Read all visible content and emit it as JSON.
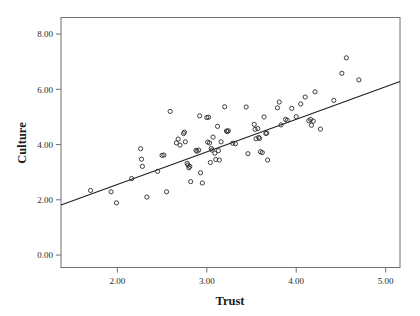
{
  "chart_data": {
    "type": "scatter",
    "title": "",
    "xlabel": "Trust",
    "ylabel": "Culture",
    "xlim": [
      1.37,
      5.16
    ],
    "ylim": [
      -0.45,
      8.6
    ],
    "xticks": [
      2.0,
      3.0,
      4.0,
      5.0
    ],
    "xtick_labels": [
      "2.00",
      "3.00",
      "4.00",
      "5.00"
    ],
    "yticks": [
      0.0,
      2.0,
      4.0,
      6.0,
      8.0
    ],
    "ytick_labels": [
      "0.00",
      "2.00",
      "4.00",
      "6.00",
      "8.00"
    ],
    "grid": false,
    "legend": "none",
    "marker": "open-circle",
    "fit_line": {
      "type": "linear",
      "x_start": 1.37,
      "y_start": 1.81,
      "x_end": 5.16,
      "y_end": 6.28,
      "slope": 1.179,
      "intercept": 0.194
    },
    "points": [
      [
        1.7,
        2.34
      ],
      [
        1.93,
        2.29
      ],
      [
        1.99,
        1.89
      ],
      [
        2.16,
        2.77
      ],
      [
        2.26,
        3.85
      ],
      [
        2.27,
        3.47
      ],
      [
        2.28,
        3.21
      ],
      [
        2.33,
        2.1
      ],
      [
        2.45,
        3.03
      ],
      [
        2.5,
        3.61
      ],
      [
        2.52,
        3.62
      ],
      [
        2.55,
        2.29
      ],
      [
        2.59,
        5.2
      ],
      [
        2.66,
        4.06
      ],
      [
        2.68,
        4.2
      ],
      [
        2.7,
        3.98
      ],
      [
        2.74,
        4.4
      ],
      [
        2.75,
        4.45
      ],
      [
        2.76,
        4.1
      ],
      [
        2.78,
        3.32
      ],
      [
        2.79,
        3.26
      ],
      [
        2.8,
        3.16
      ],
      [
        2.81,
        3.21
      ],
      [
        2.82,
        2.66
      ],
      [
        2.88,
        3.79
      ],
      [
        2.89,
        3.76
      ],
      [
        2.91,
        3.8
      ],
      [
        2.92,
        5.04
      ],
      [
        2.93,
        2.98
      ],
      [
        2.95,
        2.61
      ],
      [
        3.0,
        4.98
      ],
      [
        3.01,
        4.09
      ],
      [
        3.02,
        4.99
      ],
      [
        3.03,
        4.06
      ],
      [
        3.04,
        3.35
      ],
      [
        3.05,
        3.86
      ],
      [
        3.06,
        3.8
      ],
      [
        3.07,
        4.27
      ],
      [
        3.09,
        3.69
      ],
      [
        3.1,
        3.46
      ],
      [
        3.12,
        4.66
      ],
      [
        3.13,
        3.78
      ],
      [
        3.14,
        3.44
      ],
      [
        3.16,
        4.1
      ],
      [
        3.2,
        5.37
      ],
      [
        3.22,
        4.49
      ],
      [
        3.23,
        4.47
      ],
      [
        3.24,
        4.5
      ],
      [
        3.29,
        4.05
      ],
      [
        3.32,
        4.03
      ],
      [
        3.44,
        5.36
      ],
      [
        3.46,
        3.67
      ],
      [
        3.53,
        4.73
      ],
      [
        3.54,
        4.55
      ],
      [
        3.55,
        4.21
      ],
      [
        3.57,
        4.58
      ],
      [
        3.58,
        4.26
      ],
      [
        3.59,
        4.22
      ],
      [
        3.6,
        3.74
      ],
      [
        3.62,
        3.71
      ],
      [
        3.64,
        5.0
      ],
      [
        3.66,
        4.4
      ],
      [
        3.67,
        4.42
      ],
      [
        3.68,
        3.44
      ],
      [
        3.79,
        5.33
      ],
      [
        3.81,
        5.54
      ],
      [
        3.83,
        4.71
      ],
      [
        3.88,
        4.91
      ],
      [
        3.9,
        4.88
      ],
      [
        3.95,
        5.31
      ],
      [
        4.0,
        5.01
      ],
      [
        4.05,
        5.47
      ],
      [
        4.1,
        5.72
      ],
      [
        4.14,
        4.86
      ],
      [
        4.16,
        4.91
      ],
      [
        4.17,
        4.7
      ],
      [
        4.19,
        4.85
      ],
      [
        4.21,
        5.91
      ],
      [
        4.27,
        4.56
      ],
      [
        4.42,
        5.6
      ],
      [
        4.51,
        6.58
      ],
      [
        4.56,
        7.14
      ],
      [
        4.7,
        6.34
      ]
    ]
  },
  "axis": {
    "y_label": "Culture",
    "x_label": "Trust"
  },
  "style": {
    "frame_color": "#6f6f6f",
    "point_color": "#2a2a2a",
    "line_color": "#1d1d1d",
    "background": "#ffffff"
  }
}
